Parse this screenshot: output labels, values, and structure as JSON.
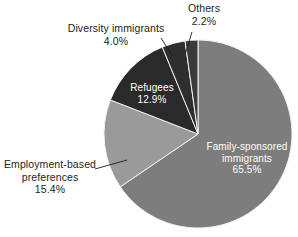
{
  "chart_data": {
    "type": "pie",
    "title": "",
    "categories": [
      "Family-sponsored immigrants",
      "Employment-based preferences",
      "Refugees",
      "Diversity immigrants",
      "Others"
    ],
    "values": [
      65.5,
      15.4,
      12.9,
      4.0,
      2.2
    ],
    "value_labels": [
      "65.5%",
      "15.4%",
      "12.9%",
      "4.0%",
      "2.2%"
    ],
    "units": "percent",
    "legend": "none",
    "grid": false,
    "start_angle_deg": 0,
    "direction": "clockwise",
    "slice_colors": [
      "#7d7d7d",
      "#9a9a9a",
      "#2a2a2a",
      "#2e2e2e",
      "#3a3a3a"
    ],
    "slices": [
      {
        "name": "Family-sponsored immigrants",
        "value": 65.5,
        "value_label": "65.5%",
        "label_line1": "Family-sponsored",
        "label_line2": "immigrants",
        "color": "#7d7d7d",
        "label_placement": "inside",
        "label_color": "#ffffff"
      },
      {
        "name": "Employment-based preferences",
        "value": 15.4,
        "value_label": "15.4%",
        "label_line1": "Employment-based",
        "label_line2": "preferences",
        "color": "#9a9a9a",
        "label_placement": "outside-left",
        "label_color": "#1c1c1c"
      },
      {
        "name": "Refugees",
        "value": 12.9,
        "value_label": "12.9%",
        "label_line1": "Refugees",
        "label_line2": "",
        "color": "#2a2a2a",
        "label_placement": "inside",
        "label_color": "#ffffff"
      },
      {
        "name": "Diversity immigrants",
        "value": 4.0,
        "value_label": "4.0%",
        "label_line1": "Diversity immigrants",
        "label_line2": "",
        "color": "#2e2e2e",
        "label_placement": "outside-top-left",
        "label_color": "#1c1c1c"
      },
      {
        "name": "Others",
        "value": 2.2,
        "value_label": "2.2%",
        "label_line1": "Others",
        "label_line2": "",
        "color": "#3a3a3a",
        "label_placement": "outside-top",
        "label_color": "#1c1c1c"
      }
    ],
    "geometry": {
      "center_x": 198,
      "center_y": 134,
      "radius": 94
    },
    "background_color": "#ffffff",
    "outline_color": "#f2f2f2"
  }
}
